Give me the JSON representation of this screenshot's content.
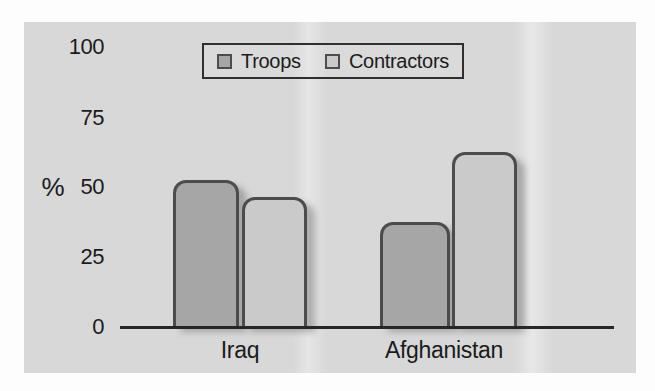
{
  "chart_data": {
    "type": "bar",
    "title": "",
    "categories": [
      "Iraq",
      "Afghanistan"
    ],
    "series": [
      {
        "name": "Troops",
        "color": "#a6a6a6",
        "values": [
          52,
          37
        ]
      },
      {
        "name": "Contractors",
        "color": "#cacaca",
        "values": [
          46,
          62
        ]
      }
    ],
    "ylabel": "%",
    "ylim": [
      0,
      100
    ],
    "yticks": [
      "100",
      "75",
      "50",
      "25",
      "0"
    ],
    "grid": false,
    "legend_position": "top-center",
    "bar_outline_color": "#4c4c4c",
    "axis_color": "#262626",
    "panel_background": "#d8d8d8",
    "text_color": "#1b1b1b"
  }
}
